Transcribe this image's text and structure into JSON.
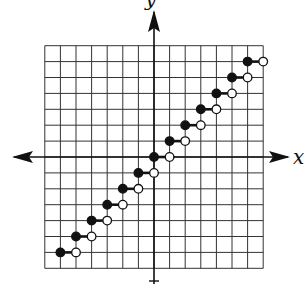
{
  "chart_data": {
    "type": "line",
    "subtype": "step-function (greatest integer / floor)",
    "title": "",
    "xlabel": "x",
    "ylabel": "y",
    "xlim": [
      -7,
      7
    ],
    "ylim": [
      -7,
      7
    ],
    "grid": true,
    "grid_step": 1,
    "tick_labels": [],
    "segments": [
      {
        "x_start": -6,
        "x_end": -5,
        "y": -6,
        "start": "closed",
        "end": "open"
      },
      {
        "x_start": -5,
        "x_end": -4,
        "y": -5,
        "start": "closed",
        "end": "open"
      },
      {
        "x_start": -4,
        "x_end": -3,
        "y": -4,
        "start": "closed",
        "end": "open"
      },
      {
        "x_start": -3,
        "x_end": -2,
        "y": -3,
        "start": "closed",
        "end": "open"
      },
      {
        "x_start": -2,
        "x_end": -1,
        "y": -2,
        "start": "closed",
        "end": "open"
      },
      {
        "x_start": -1,
        "x_end": 0,
        "y": -1,
        "start": "closed",
        "end": "open"
      },
      {
        "x_start": 0,
        "x_end": 1,
        "y": 0,
        "start": "closed",
        "end": "open"
      },
      {
        "x_start": 1,
        "x_end": 2,
        "y": 1,
        "start": "closed",
        "end": "open"
      },
      {
        "x_start": 2,
        "x_end": 3,
        "y": 2,
        "start": "closed",
        "end": "open"
      },
      {
        "x_start": 3,
        "x_end": 4,
        "y": 3,
        "start": "closed",
        "end": "open"
      },
      {
        "x_start": 4,
        "x_end": 5,
        "y": 4,
        "start": "closed",
        "end": "open"
      },
      {
        "x_start": 5,
        "x_end": 6,
        "y": 5,
        "start": "closed",
        "end": "open"
      },
      {
        "x_start": 6,
        "x_end": 7,
        "y": 6,
        "start": "closed",
        "end": "open"
      }
    ],
    "colors": {
      "line": "#111111",
      "grid": "#333333",
      "open_fill": "#ffffff"
    }
  }
}
